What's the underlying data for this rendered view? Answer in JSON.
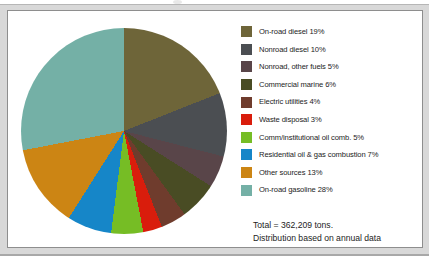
{
  "chart_data": {
    "type": "pie",
    "title": "",
    "subtitle": "",
    "xlabel": "",
    "ylabel": "",
    "legend_position": "right",
    "grid": false,
    "start_angle_deg": 0,
    "direction": "clockwise",
    "units": "tons",
    "total_value": 362209,
    "categories": [
      "On-road diesel",
      "Nonroad diesel",
      "Nonroad, other fuels",
      "Commercial marine",
      "Electric utilities",
      "Waste disposal",
      "Comm/institutional oil comb.",
      "Residential oil & gas combustion",
      "Other sources",
      "On-road gasoline"
    ],
    "values": [
      19,
      10,
      5,
      6,
      4,
      3,
      5,
      7,
      13,
      28
    ],
    "value_unit": "percent",
    "colors": [
      "#6e6539",
      "#4b4e52",
      "#594549",
      "#494c24",
      "#6f3c2d",
      "#d91d0c",
      "#76bd25",
      "#1686c8",
      "#cc8514",
      "#74b0a6"
    ],
    "slices": [
      {
        "label": "On-road diesel",
        "value": 19,
        "display": "19%",
        "color": "#6e6539"
      },
      {
        "label": "Nonroad diesel",
        "value": 10,
        "display": "10%",
        "color": "#4b4e52"
      },
      {
        "label": "Nonroad, other fuels",
        "value": 5,
        "display": "5%",
        "color": "#594549"
      },
      {
        "label": "Commercial marine",
        "value": 6,
        "display": "6%",
        "color": "#494c24"
      },
      {
        "label": "Electric utilities",
        "value": 4,
        "display": "4%",
        "color": "#6f3c2d"
      },
      {
        "label": "Waste disposal",
        "value": 3,
        "display": "3%",
        "color": "#d91d0c"
      },
      {
        "label": "Comm/institutional oil comb.",
        "value": 5,
        "display": "5%",
        "color": "#76bd25"
      },
      {
        "label": "Residential oil & gas combustion",
        "value": 7,
        "display": "7%",
        "color": "#1686c8"
      },
      {
        "label": "Other sources",
        "value": 13,
        "display": "13%",
        "color": "#cc8514"
      },
      {
        "label": "On-road gasoline",
        "value": 28,
        "display": "28%",
        "color": "#74b0a6"
      }
    ],
    "annotations": [
      "Total = 362,209 tons.",
      "Distribution based on annual data"
    ]
  },
  "legend": {
    "items": [
      {
        "label": "On-road diesel 19%",
        "color": "#6e6539"
      },
      {
        "label": "Nonroad diesel 10%",
        "color": "#4b4e52"
      },
      {
        "label": "Nonroad, other fuels 5%",
        "color": "#594549"
      },
      {
        "label": "Commercial marine 6%",
        "color": "#494c24"
      },
      {
        "label": "Electric utilities 4%",
        "color": "#6f3c2d"
      },
      {
        "label": "Waste disposal 3%",
        "color": "#d91d0c"
      },
      {
        "label": "Comm/institutional oil comb. 5%",
        "color": "#76bd25"
      },
      {
        "label": "Residential oil & gas combustion 7%",
        "color": "#1686c8"
      },
      {
        "label": "Other sources 13%",
        "color": "#cc8514"
      },
      {
        "label": "On-road gasoline 28%",
        "color": "#74b0a6"
      }
    ]
  },
  "footnote": {
    "line1": "Total = 362,209 tons.",
    "line2": "Distribution based on annual data"
  }
}
